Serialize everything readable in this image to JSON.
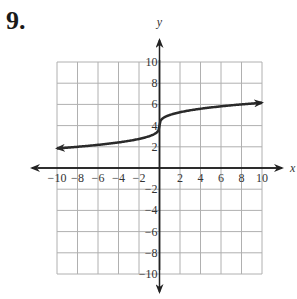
{
  "problem": {
    "number": "9."
  },
  "chart_data": {
    "type": "line",
    "title": "",
    "xlabel": "x",
    "ylabel": "y",
    "xlim": [
      -10,
      10
    ],
    "ylim": [
      -10,
      10
    ],
    "grid": true,
    "grid_step": 2,
    "x_ticks": [
      "-10",
      "-8",
      "-6",
      "-4",
      "-2",
      "2",
      "4",
      "6",
      "8",
      "10"
    ],
    "y_ticks": [
      "10",
      "8",
      "6",
      "4",
      "2",
      "-2",
      "-4",
      "-6",
      "-8",
      "-10"
    ],
    "series": [
      {
        "name": "f(x)",
        "description": "cube-root shaped curve with arrows at both ends, shifted up 4",
        "x": [
          -10,
          -8,
          -6,
          -4,
          -2,
          -1,
          0,
          1,
          2,
          4,
          6,
          8,
          10
        ],
        "y": [
          1.85,
          2,
          2.18,
          2.41,
          2.74,
          3,
          4,
          5,
          5.26,
          5.59,
          5.82,
          6,
          6.15
        ]
      }
    ],
    "colors": {
      "grid": "#b0b0b0",
      "axis": "#222222",
      "curve": "#2a2a2a"
    }
  }
}
